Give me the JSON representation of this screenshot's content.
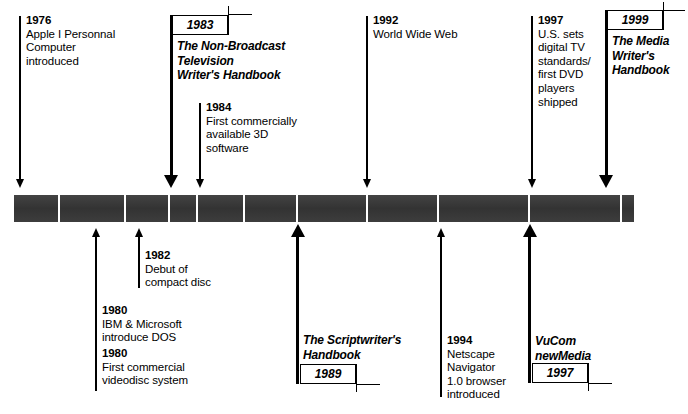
{
  "diagram": {
    "type": "timeline",
    "bar": {
      "color": "#3a3a3a"
    }
  },
  "above_entries": [
    {
      "id": "e1976",
      "year": "1976",
      "text": "Apple I Personnal\nComputer\nintroduced"
    },
    {
      "id": "e1984",
      "year": "1984",
      "text": "First commercially\navailable 3D\nsoftware"
    },
    {
      "id": "e1992",
      "year": "1992",
      "text": "World Wide Web"
    },
    {
      "id": "e1997",
      "year": "1997",
      "text": "U.S. sets\ndigital TV\nstandards/\nfirst DVD\nplayers\nshipped"
    }
  ],
  "below_entries": [
    {
      "id": "e1982",
      "year": "1982",
      "text": "Debut of\ncompact disc"
    },
    {
      "id": "e1980a",
      "year": "1980",
      "text": "IBM & Microsoft\nintroduce DOS"
    },
    {
      "id": "e1980b",
      "year": "1980",
      "text": "First commercial\nvideodisc system"
    },
    {
      "id": "e1994",
      "year": "1994",
      "text": "Netscape\nNavigator\n1.0 browser\nintroduced"
    }
  ],
  "books": [
    {
      "id": "b1983",
      "year": "1983",
      "title": "The Non-Broadcast\nTelevision\nWriter's Handbook",
      "position": "above"
    },
    {
      "id": "b1999",
      "year": "1999",
      "title": "The Media\nWriter's\nHandbook",
      "position": "above"
    },
    {
      "id": "b1989",
      "year": "1989",
      "title": "The Scriptwriter's\nHandbook",
      "position": "below"
    },
    {
      "id": "b1997",
      "year": "1997",
      "title": "VuCom\nnewMedia",
      "position": "below"
    }
  ]
}
